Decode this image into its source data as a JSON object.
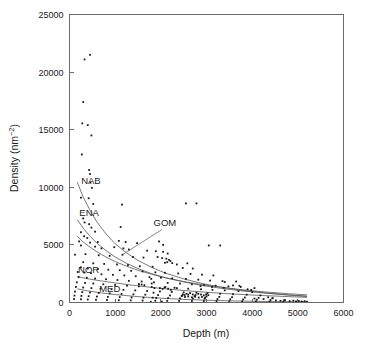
{
  "chart_data": {
    "type": "scatter",
    "title": "",
    "xlabel": "Depth (m)",
    "ylabel": "Density (nm⁻²)",
    "ylabel_base": "Density (nm",
    "ylabel_exp": "−2",
    "ylabel_close": ")",
    "xlim": [
      0,
      6000
    ],
    "ylim": [
      0,
      25000
    ],
    "xticks": [
      0,
      1000,
      2000,
      3000,
      4000,
      5000,
      6000
    ],
    "xticklabels": [
      "0",
      "1000",
      "2000",
      "3000",
      "4000",
      "5000",
      "6000"
    ],
    "yticks": [
      0,
      5000,
      10000,
      15000,
      20000,
      25000
    ],
    "yticklabels": [
      "0",
      "5000",
      "10000",
      "15000",
      "20000",
      "25000"
    ],
    "grid": false,
    "legend": "inline-curve-labels",
    "marker": "square",
    "marker_color": "#1a1a1a",
    "curve_color": "#555555",
    "frame_color": "#6b6b6b",
    "series": [
      {
        "name": "NAB",
        "label": "NAB",
        "label_x": 470,
        "label_y": 10250,
        "curve": [
          [
            170,
            10450
          ],
          [
            300,
            9150
          ],
          [
            450,
            8000
          ],
          [
            600,
            7000
          ],
          [
            800,
            5950
          ],
          [
            1000,
            5100
          ],
          [
            1250,
            4300
          ],
          [
            1500,
            3650
          ],
          [
            1800,
            3050
          ],
          [
            2100,
            2550
          ],
          [
            2500,
            2050
          ],
          [
            2900,
            1650
          ],
          [
            3300,
            1350
          ],
          [
            3800,
            1050
          ],
          [
            4300,
            820
          ],
          [
            4800,
            640
          ],
          [
            5200,
            520
          ]
        ]
      },
      {
        "name": "ENA",
        "label": "ENA",
        "label_x": 430,
        "label_y": 7550,
        "curve": [
          [
            170,
            7200
          ],
          [
            300,
            6450
          ],
          [
            450,
            5750
          ],
          [
            600,
            5150
          ],
          [
            800,
            4500
          ],
          [
            1000,
            3950
          ],
          [
            1250,
            3400
          ],
          [
            1500,
            2950
          ],
          [
            1800,
            2500
          ],
          [
            2100,
            2150
          ],
          [
            2500,
            1780
          ],
          [
            2900,
            1480
          ],
          [
            3300,
            1240
          ],
          [
            3800,
            1000
          ],
          [
            4300,
            810
          ],
          [
            4800,
            660
          ],
          [
            5200,
            560
          ]
        ]
      },
      {
        "name": "GOM",
        "label": "GOM",
        "label_x": 2090,
        "label_y": 6650,
        "leader": [
          [
            2030,
            6350
          ],
          [
            1160,
            4150
          ]
        ],
        "curve": [
          [
            170,
            5750
          ],
          [
            300,
            5250
          ],
          [
            450,
            4800
          ],
          [
            600,
            4400
          ],
          [
            800,
            3950
          ],
          [
            1000,
            3550
          ],
          [
            1250,
            3150
          ],
          [
            1500,
            2800
          ],
          [
            1800,
            2450
          ],
          [
            2100,
            2150
          ],
          [
            2500,
            1820
          ],
          [
            2900,
            1550
          ],
          [
            3300,
            1330
          ],
          [
            3800,
            1100
          ],
          [
            4300,
            910
          ],
          [
            4800,
            760
          ],
          [
            5200,
            660
          ]
        ]
      },
      {
        "name": "NOR",
        "label": "NOR",
        "label_x": 420,
        "label_y": 2600,
        "curve": [
          [
            170,
            2250
          ],
          [
            400,
            2060
          ],
          [
            700,
            1870
          ],
          [
            1000,
            1700
          ],
          [
            1400,
            1490
          ],
          [
            1800,
            1310
          ],
          [
            2200,
            1150
          ],
          [
            2600,
            1010
          ],
          [
            3000,
            890
          ],
          [
            3400,
            780
          ],
          [
            3800,
            690
          ],
          [
            4300,
            590
          ],
          [
            4800,
            510
          ],
          [
            5200,
            450
          ]
        ]
      },
      {
        "name": "MED",
        "label": "MED",
        "label_x": 880,
        "label_y": 900,
        "curve": [
          [
            170,
            1180
          ],
          [
            400,
            1010
          ],
          [
            700,
            830
          ],
          [
            1000,
            690
          ],
          [
            1400,
            540
          ],
          [
            1800,
            420
          ],
          [
            2200,
            330
          ],
          [
            2600,
            255
          ],
          [
            3000,
            200
          ],
          [
            3400,
            155
          ],
          [
            3800,
            120
          ],
          [
            4300,
            88
          ],
          [
            4800,
            66
          ],
          [
            5200,
            52
          ]
        ]
      }
    ],
    "points": [
      [
        330,
        21100
      ],
      [
        450,
        21500
      ],
      [
        300,
        17400
      ],
      [
        280,
        15550
      ],
      [
        400,
        15400
      ],
      [
        480,
        14500
      ],
      [
        270,
        12850
      ],
      [
        430,
        11500
      ],
      [
        450,
        11150
      ],
      [
        460,
        10400
      ],
      [
        490,
        9950
      ],
      [
        250,
        9100
      ],
      [
        420,
        9050
      ],
      [
        520,
        8550
      ],
      [
        1150,
        8500
      ],
      [
        2550,
        8600
      ],
      [
        300,
        7300
      ],
      [
        330,
        6950
      ],
      [
        430,
        6800
      ],
      [
        480,
        6500
      ],
      [
        250,
        6100
      ],
      [
        560,
        6150
      ],
      [
        1120,
        6550
      ],
      [
        320,
        5750
      ],
      [
        390,
        5600
      ],
      [
        210,
        5300
      ],
      [
        450,
        5200
      ],
      [
        620,
        5250
      ],
      [
        1080,
        5350
      ],
      [
        1230,
        5250
      ],
      [
        1480,
        5150
      ],
      [
        1960,
        5300
      ],
      [
        2050,
        5000
      ],
      [
        3050,
        4950
      ],
      [
        250,
        4950
      ],
      [
        560,
        4850
      ],
      [
        700,
        4700
      ],
      [
        980,
        4800
      ],
      [
        1180,
        4700
      ],
      [
        1300,
        4600
      ],
      [
        1700,
        4500
      ],
      [
        1890,
        4450
      ],
      [
        2050,
        4400
      ],
      [
        2150,
        4250
      ],
      [
        120,
        4150
      ],
      [
        350,
        4200
      ],
      [
        640,
        4100
      ],
      [
        880,
        4050
      ],
      [
        1160,
        4150
      ],
      [
        1390,
        3950
      ],
      [
        1620,
        3900
      ],
      [
        1930,
        3950
      ],
      [
        2030,
        3850
      ],
      [
        2120,
        3800
      ],
      [
        2180,
        3700
      ],
      [
        2210,
        3600
      ],
      [
        2140,
        3500
      ],
      [
        2090,
        3450
      ],
      [
        2250,
        3420
      ],
      [
        2350,
        3300
      ],
      [
        2580,
        3400
      ],
      [
        300,
        3500
      ],
      [
        520,
        3400
      ],
      [
        760,
        3350
      ],
      [
        1040,
        3300
      ],
      [
        1280,
        3250
      ],
      [
        1540,
        3150
      ],
      [
        1820,
        3100
      ],
      [
        2480,
        3000
      ],
      [
        2700,
        2950
      ],
      [
        250,
        3050
      ],
      [
        400,
        2950
      ],
      [
        620,
        2900
      ],
      [
        850,
        2850
      ],
      [
        1100,
        2800
      ],
      [
        1350,
        2750
      ],
      [
        1600,
        2700
      ],
      [
        1880,
        2620
      ],
      [
        2090,
        2580
      ],
      [
        2380,
        2520
      ],
      [
        2650,
        2480
      ],
      [
        2900,
        2420
      ],
      [
        3150,
        2350
      ],
      [
        3400,
        1780
      ],
      [
        3650,
        1820
      ],
      [
        180,
        2650
      ],
      [
        330,
        2600
      ],
      [
        470,
        2550
      ],
      [
        700,
        2450
      ],
      [
        950,
        2400
      ],
      [
        1200,
        2350
      ],
      [
        1450,
        2280
      ],
      [
        1750,
        2200
      ],
      [
        2000,
        2150
      ],
      [
        2250,
        2100
      ],
      [
        2550,
        2050
      ],
      [
        2820,
        1980
      ],
      [
        3080,
        1900
      ],
      [
        3350,
        1850
      ],
      [
        3580,
        1480
      ],
      [
        3720,
        1450
      ],
      [
        200,
        2200
      ],
      [
        380,
        2150
      ],
      [
        560,
        2080
      ],
      [
        800,
        2020
      ],
      [
        1050,
        1950
      ],
      [
        1300,
        1880
      ],
      [
        1580,
        1820
      ],
      [
        1850,
        1750
      ],
      [
        2150,
        1700
      ],
      [
        2420,
        1640
      ],
      [
        2680,
        1580
      ],
      [
        2950,
        1520
      ],
      [
        3200,
        1460
      ],
      [
        3480,
        1400
      ],
      [
        3750,
        1350
      ],
      [
        4050,
        1250
      ],
      [
        160,
        1750
      ],
      [
        340,
        1700
      ],
      [
        520,
        1650
      ],
      [
        740,
        1580
      ],
      [
        1000,
        1520
      ],
      [
        1260,
        1460
      ],
      [
        1520,
        1400
      ],
      [
        1800,
        1350
      ],
      [
        2080,
        1300
      ],
      [
        2350,
        1250
      ],
      [
        2600,
        1200
      ],
      [
        2880,
        1150
      ],
      [
        3130,
        1100
      ],
      [
        3400,
        1050
      ],
      [
        3700,
        980
      ],
      [
        4000,
        900
      ],
      [
        140,
        1350
      ],
      [
        300,
        1300
      ],
      [
        480,
        1250
      ],
      [
        680,
        1200
      ],
      [
        920,
        1150
      ],
      [
        1180,
        1100
      ],
      [
        1440,
        1050
      ],
      [
        1700,
        1000
      ],
      [
        1980,
        960
      ],
      [
        2240,
        920
      ],
      [
        2500,
        880
      ],
      [
        2780,
        840
      ],
      [
        3020,
        800
      ],
      [
        3300,
        760
      ],
      [
        3580,
        720
      ],
      [
        3880,
        680
      ],
      [
        4180,
        620
      ],
      [
        120,
        950
      ],
      [
        280,
        900
      ],
      [
        450,
        870
      ],
      [
        640,
        830
      ],
      [
        880,
        790
      ],
      [
        1140,
        750
      ],
      [
        1400,
        710
      ],
      [
        1660,
        680
      ],
      [
        1940,
        640
      ],
      [
        2200,
        610
      ],
      [
        2460,
        580
      ],
      [
        2740,
        550
      ],
      [
        3000,
        520
      ],
      [
        3280,
        490
      ],
      [
        3560,
        460
      ],
      [
        3840,
        430
      ],
      [
        4140,
        400
      ],
      [
        4440,
        360
      ],
      [
        110,
        600
      ],
      [
        260,
        570
      ],
      [
        420,
        550
      ],
      [
        600,
        520
      ],
      [
        840,
        490
      ],
      [
        1100,
        470
      ],
      [
        1360,
        440
      ],
      [
        1620,
        420
      ],
      [
        1900,
        400
      ],
      [
        2160,
        380
      ],
      [
        2420,
        360
      ],
      [
        2700,
        340
      ],
      [
        2960,
        320
      ],
      [
        3240,
        300
      ],
      [
        3520,
        280
      ],
      [
        3800,
        260
      ],
      [
        4100,
        240
      ],
      [
        4400,
        220
      ],
      [
        4700,
        200
      ],
      [
        100,
        300
      ],
      [
        250,
        280
      ],
      [
        400,
        260
      ],
      [
        580,
        240
      ],
      [
        820,
        220
      ],
      [
        1080,
        200
      ],
      [
        1340,
        185
      ],
      [
        1600,
        170
      ],
      [
        1880,
        155
      ],
      [
        2140,
        145
      ],
      [
        2400,
        135
      ],
      [
        2680,
        125
      ],
      [
        2940,
        115
      ],
      [
        3220,
        105
      ],
      [
        3500,
        95
      ],
      [
        3780,
        88
      ],
      [
        4080,
        80
      ],
      [
        4380,
        72
      ],
      [
        4680,
        64
      ],
      [
        4980,
        56
      ],
      [
        5100,
        50
      ],
      [
        1780,
        60
      ],
      [
        1820,
        420
      ],
      [
        1840,
        850
      ],
      [
        1860,
        1250
      ],
      [
        1800,
        1650
      ],
      [
        1790,
        2050
      ],
      [
        2020,
        80
      ],
      [
        2480,
        700
      ],
      [
        2520,
        640
      ],
      [
        2560,
        760
      ],
      [
        2600,
        690
      ],
      [
        2640,
        820
      ],
      [
        2700,
        700
      ],
      [
        2760,
        640
      ],
      [
        2820,
        750
      ],
      [
        2880,
        690
      ],
      [
        2940,
        620
      ],
      [
        2990,
        700
      ],
      [
        3040,
        640
      ],
      [
        2460,
        560
      ],
      [
        2530,
        480
      ],
      [
        2600,
        520
      ],
      [
        2680,
        450
      ],
      [
        2750,
        500
      ],
      [
        2830,
        430
      ],
      [
        2900,
        480
      ],
      [
        2970,
        420
      ],
      [
        1980,
        1250
      ],
      [
        2040,
        1180
      ],
      [
        2100,
        1350
      ],
      [
        2160,
        1200
      ],
      [
        2220,
        1100
      ],
      [
        2300,
        1280
      ],
      [
        4520,
        180
      ],
      [
        4620,
        150
      ],
      [
        4720,
        200
      ],
      [
        4820,
        120
      ],
      [
        4900,
        160
      ],
      [
        4960,
        100
      ],
      [
        5020,
        130
      ],
      [
        5080,
        90
      ],
      [
        5150,
        110
      ],
      [
        5200,
        70
      ],
      [
        4350,
        450
      ],
      [
        4450,
        380
      ],
      [
        3900,
        1150
      ],
      [
        3980,
        1100
      ],
      [
        3300,
        4950
      ],
      [
        2780,
        8600
      ],
      [
        4250,
        300
      ],
      [
        4050,
        340
      ],
      [
        2870,
        1420
      ],
      [
        3120,
        1350
      ],
      [
        3380,
        1280
      ],
      [
        1640,
        1500
      ],
      [
        1580,
        1560
      ],
      [
        1520,
        1600
      ]
    ]
  }
}
